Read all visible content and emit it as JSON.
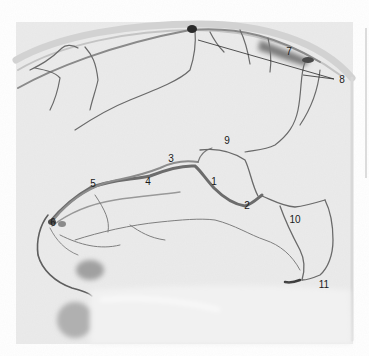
{
  "figure": {
    "type": "lateral cerebral venous angiogram",
    "background_color": "#ffffff",
    "film_color": "#e9e9e9",
    "vessel_color": "#4a4a4a",
    "label_color": "#1a1a1a"
  },
  "labels": [
    {
      "id": "1",
      "text": "1",
      "x": 214,
      "y": 182
    },
    {
      "id": "2",
      "text": "2",
      "x": 247,
      "y": 206
    },
    {
      "id": "3",
      "text": "3",
      "x": 171,
      "y": 159
    },
    {
      "id": "4",
      "text": "4",
      "x": 148,
      "y": 182
    },
    {
      "id": "5",
      "text": "5",
      "x": 93,
      "y": 184
    },
    {
      "id": "6",
      "text": "6",
      "x": 53,
      "y": 223
    },
    {
      "id": "7",
      "text": "7",
      "x": 289,
      "y": 52
    },
    {
      "id": "8",
      "text": "8",
      "x": 342,
      "y": 80
    },
    {
      "id": "9",
      "text": "9",
      "x": 227,
      "y": 141
    },
    {
      "id": "10",
      "text": "10",
      "x": 295,
      "y": 220
    },
    {
      "id": "11",
      "text": "11",
      "x": 324,
      "y": 285
    }
  ],
  "leader_lines": [
    {
      "from_label": "8",
      "x1": 334,
      "y1": 79,
      "x2": 198,
      "y2": 40
    },
    {
      "from_label": "8",
      "x1": 334,
      "y1": 79,
      "x2": 303,
      "y2": 75
    }
  ]
}
